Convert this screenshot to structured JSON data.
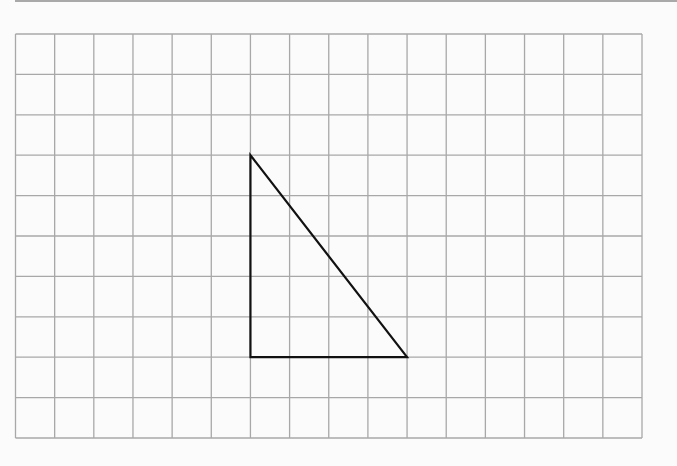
{
  "diagram": {
    "type": "grid_with_triangle",
    "grid": {
      "columns": 16,
      "rows": 10,
      "left": 15.5,
      "top": 34,
      "right": 642,
      "bottom": 438,
      "line_color": "#a8a8a8"
    },
    "triangle": {
      "description": "Right triangle on grid; vertical leg 5 units, horizontal leg 4 units",
      "vertices_grid": [
        [
          6,
          3
        ],
        [
          6,
          8
        ],
        [
          10,
          8
        ]
      ],
      "stroke": "#111111"
    }
  }
}
